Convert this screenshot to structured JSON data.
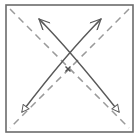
{
  "figure": {
    "kind": "origami-fold-diagram",
    "caption": "",
    "canvas": {
      "width": 139,
      "height": 139,
      "background": "#ffffff"
    }
  },
  "colors": {
    "frame_stroke": "#6b6b6b",
    "crease_stroke": "#9a9a9a",
    "arrow_stroke": "#595959",
    "arrow_fill": "#ffffff",
    "center_mark": "#4d4d4d",
    "paper_fill": "#ffffff"
  },
  "sheet": {
    "name": "paper-square",
    "x": 6,
    "y": 5,
    "width": 127,
    "height": 127,
    "stroke_width": 1.6,
    "label": "paper sheet"
  },
  "creases": [
    {
      "name": "crease-diagonal-tl-br",
      "label": "diagonal crease top-left to bottom-right",
      "style": "dashed",
      "dash": "7 5",
      "stroke_width": 1.5,
      "x1": 10,
      "y1": 9,
      "x2": 129,
      "y2": 128
    },
    {
      "name": "crease-diagonal-tr-bl",
      "label": "diagonal crease top-right to bottom-left",
      "style": "dashed",
      "dash": "7 5",
      "stroke_width": 1.5,
      "x1": 129,
      "y1": 9,
      "x2": 10,
      "y2": 128
    }
  ],
  "arrows": [
    {
      "name": "fold-arrow-left-up",
      "label": "curved arrow from bottom-right to top-left",
      "path": "M 119,112 C 92,78 60,40 39,19",
      "stroke_width": 1.5,
      "head_start": {
        "type": "hollow-triangle",
        "at": "bottom-right"
      },
      "head_end": {
        "type": "open-barb",
        "at": "top-left"
      }
    },
    {
      "name": "fold-arrow-right-up",
      "label": "curved arrow from bottom-left to top-right",
      "path": "M 22,112 C 48,78 80,40 101,19",
      "stroke_width": 1.5,
      "head_start": {
        "type": "hollow-triangle",
        "at": "bottom-left"
      },
      "head_end": {
        "type": "open-barb",
        "at": "top-right"
      }
    }
  ],
  "center_mark": {
    "name": "center-cross-mark",
    "label": "center reference x mark",
    "symbol": "x",
    "cx": 68,
    "cy": 69,
    "size": 5,
    "stroke_width": 1.4
  },
  "accessibility": {
    "alt_text": "A square sheet of paper with two dashed diagonal crease lines and two solid curved arrows crossing near the top, indicating folding motions from the lower corners toward the opposite upper corners, with a small x marking the center."
  }
}
